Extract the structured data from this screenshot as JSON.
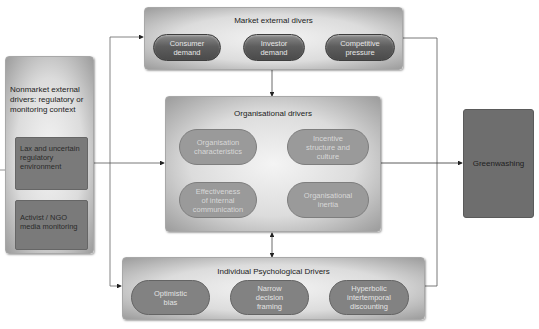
{
  "diagram": {
    "market": {
      "title": "Market external divers",
      "items": [
        "Consumer demand",
        "Investor demand",
        "Competitive pressure"
      ]
    },
    "nonmarket": {
      "title": "Nonmarket external drivers: regulatory or monitoring context",
      "items": [
        "Lax and uncertain regulatory environment",
        "Activist / NGO media monitoring"
      ]
    },
    "organisational": {
      "title": "Organisational drivers",
      "items": [
        "Organisation characteristics",
        "Incentive structure and culture",
        "Effectiveness of internal communication",
        "Organisational inertia"
      ]
    },
    "individual": {
      "title": "Individual Psychological Drivers",
      "items": [
        "Optimistic bias",
        "Narrow decision framing",
        "Hyperbolic intertemporal discounting"
      ]
    },
    "outcome": {
      "label": "Greenwashing"
    },
    "connectors": [
      {
        "from": "nonmarket",
        "to": "market"
      },
      {
        "from": "nonmarket",
        "to": "organisational"
      },
      {
        "from": "nonmarket",
        "to": "individual"
      },
      {
        "from": "market",
        "to": "organisational"
      },
      {
        "from": "organisational",
        "to": "individual",
        "bidirectional": true
      },
      {
        "from": "organisational",
        "to": "outcome"
      },
      {
        "from": "market",
        "to": "outcome"
      },
      {
        "from": "individual",
        "to": "outcome"
      }
    ]
  }
}
